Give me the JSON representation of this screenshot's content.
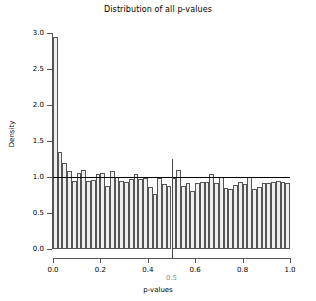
{
  "chart_data": {
    "type": "bar",
    "title": "Distribution of all p-values",
    "xlabel": "p-values",
    "ylabel": "Density",
    "xlim": [
      0.0,
      1.0
    ],
    "ylim": [
      0.0,
      3.0
    ],
    "grid": false,
    "legend": null,
    "bin_width": 0.02,
    "bin_edges": [
      0.0,
      0.02,
      0.04,
      0.06,
      0.08,
      0.1,
      0.12,
      0.14,
      0.16,
      0.18,
      0.2,
      0.22,
      0.24,
      0.26,
      0.28,
      0.3,
      0.32,
      0.34,
      0.36,
      0.38,
      0.4,
      0.42,
      0.44,
      0.46,
      0.48,
      0.5,
      0.52,
      0.54,
      0.56,
      0.58,
      0.6,
      0.62,
      0.64,
      0.66,
      0.68,
      0.7,
      0.72,
      0.74,
      0.76,
      0.78,
      0.8,
      0.82,
      0.84,
      0.86,
      0.88,
      0.9,
      0.92,
      0.94,
      0.96,
      0.98,
      1.0
    ],
    "categories": [
      "0.01",
      "0.03",
      "0.05",
      "0.07",
      "0.09",
      "0.11",
      "0.13",
      "0.15",
      "0.17",
      "0.19",
      "0.21",
      "0.23",
      "0.25",
      "0.27",
      "0.29",
      "0.31",
      "0.33",
      "0.35",
      "0.37",
      "0.39",
      "0.41",
      "0.43",
      "0.45",
      "0.47",
      "0.49",
      "0.51",
      "0.53",
      "0.55",
      "0.57",
      "0.59",
      "0.61",
      "0.63",
      "0.65",
      "0.67",
      "0.69",
      "0.71",
      "0.73",
      "0.75",
      "0.77",
      "0.79",
      "0.81",
      "0.83",
      "0.85",
      "0.87",
      "0.89",
      "0.91",
      "0.93",
      "0.95",
      "0.97",
      "0.99"
    ],
    "values": [
      2.95,
      1.35,
      1.2,
      1.08,
      0.94,
      1.05,
      1.1,
      0.95,
      0.96,
      1.04,
      1.05,
      0.87,
      1.09,
      1.0,
      0.94,
      0.93,
      0.97,
      1.04,
      0.97,
      0.99,
      0.86,
      0.77,
      0.99,
      0.9,
      0.87,
      0.99,
      1.1,
      0.87,
      0.92,
      0.81,
      0.92,
      0.93,
      0.93,
      1.04,
      0.92,
      1.0,
      0.85,
      0.84,
      0.89,
      0.93,
      0.9,
      1.0,
      0.84,
      0.86,
      0.92,
      0.91,
      0.93,
      0.95,
      0.93,
      0.92
    ],
    "ytick_labels": [
      "0.0",
      "0.5",
      "1.0",
      "1.5",
      "2.0",
      "2.5",
      "3.0"
    ],
    "ytick_values": [
      0.0,
      0.5,
      1.0,
      1.5,
      2.0,
      2.5,
      3.0
    ],
    "xtick_labels": [
      "0.0",
      "0.2",
      "0.4",
      "0.6",
      "0.8",
      "1.0"
    ],
    "xtick_values": [
      0.0,
      0.2,
      0.4,
      0.6,
      0.8,
      1.0
    ],
    "annotations": [
      {
        "name": "reference-line-density-1",
        "type": "hline",
        "y": 1.0,
        "color": "#000000"
      },
      {
        "name": "threshold-line-p-0.5",
        "type": "vline",
        "x": 0.5,
        "y_top": 1.25,
        "color": "#444444",
        "label": "0.5",
        "label_color": "#8c8c8c"
      }
    ],
    "bar_fill": "#f0f0f0",
    "bar_border": "#555555"
  }
}
